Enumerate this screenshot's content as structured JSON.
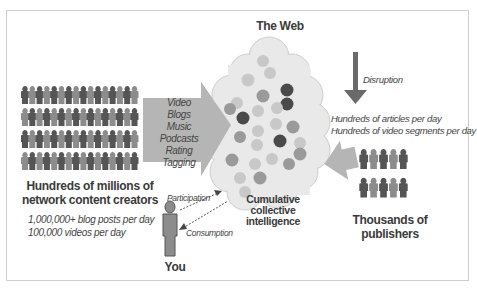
{
  "diagram": {
    "web": {
      "title": "The Web",
      "cloud_fill": "#ececec",
      "cloud_stroke": "#d6d6d6",
      "circles": [
        {
          "x": 263,
          "y": 61,
          "r": 6,
          "tone": "light"
        },
        {
          "x": 270,
          "y": 73,
          "r": 6,
          "tone": "light"
        },
        {
          "x": 248,
          "y": 80,
          "r": 6.5,
          "tone": "light"
        },
        {
          "x": 287,
          "y": 90,
          "r": 6.5,
          "tone": "dark"
        },
        {
          "x": 263,
          "y": 96,
          "r": 6.5,
          "tone": "mid"
        },
        {
          "x": 287,
          "y": 104,
          "r": 6.5,
          "tone": "dark"
        },
        {
          "x": 237,
          "y": 103,
          "r": 6,
          "tone": "light"
        },
        {
          "x": 230,
          "y": 109,
          "r": 6,
          "tone": "mid"
        },
        {
          "x": 277,
          "y": 108,
          "r": 6,
          "tone": "light"
        },
        {
          "x": 258,
          "y": 111,
          "r": 6,
          "tone": "light"
        },
        {
          "x": 243,
          "y": 118,
          "r": 6.5,
          "tone": "dark"
        },
        {
          "x": 276,
          "y": 124,
          "r": 6,
          "tone": "light"
        },
        {
          "x": 258,
          "y": 131,
          "r": 6,
          "tone": "light"
        },
        {
          "x": 293,
          "y": 127,
          "r": 6.5,
          "tone": "mid"
        },
        {
          "x": 240,
          "y": 137,
          "r": 6,
          "tone": "mid"
        },
        {
          "x": 280,
          "y": 141,
          "r": 6.5,
          "tone": "dark"
        },
        {
          "x": 257,
          "y": 145,
          "r": 6,
          "tone": "light"
        },
        {
          "x": 300,
          "y": 143,
          "r": 6,
          "tone": "light"
        },
        {
          "x": 232,
          "y": 160,
          "r": 6.5,
          "tone": "mid"
        },
        {
          "x": 255,
          "y": 164,
          "r": 6,
          "tone": "light"
        },
        {
          "x": 272,
          "y": 159,
          "r": 6,
          "tone": "light"
        },
        {
          "x": 300,
          "y": 154,
          "r": 6.5,
          "tone": "mid"
        },
        {
          "x": 289,
          "y": 164,
          "r": 6,
          "tone": "mid"
        },
        {
          "x": 240,
          "y": 178,
          "r": 6,
          "tone": "light"
        },
        {
          "x": 260,
          "y": 178,
          "r": 6.5,
          "tone": "mid"
        },
        {
          "x": 245,
          "y": 192,
          "r": 6,
          "tone": "light"
        }
      ],
      "tone_colors": {
        "light": "#c8c8c8",
        "mid": "#9a9a9a",
        "dark": "#4a4a4a"
      }
    },
    "creators": {
      "title_line1": "Hundreds of millions of",
      "title_line2": "network content creators",
      "stat1": "1,000,000+ blog posts per day",
      "stat2": "100,000 videos per day",
      "grid_rows": 4,
      "grid_cols": 16
    },
    "media_types": [
      "Video",
      "Blogs",
      "Music",
      "Podcasts",
      "Rating",
      "Tagging"
    ],
    "disruption": {
      "label": "Disruption",
      "stat1": "Hundreds of articles per day",
      "stat2": "Hundreds of video segments per day"
    },
    "publishers": {
      "title_line1": "Thousands of",
      "title_line2": "publishers",
      "grid_rows": 2,
      "grid_cols": 5
    },
    "collective": {
      "line1": "Cumulative",
      "line2": "collective",
      "line3": "intelligence"
    },
    "you": {
      "label": "You",
      "participation": "Participation",
      "consumption": "Consumption"
    },
    "colors": {
      "arrow_gray": "#b5b5b5",
      "person_dark": "#555555",
      "person_light": "#8c8c8c",
      "text": "#3a3a3a",
      "frame": "#cfcfcf"
    }
  }
}
